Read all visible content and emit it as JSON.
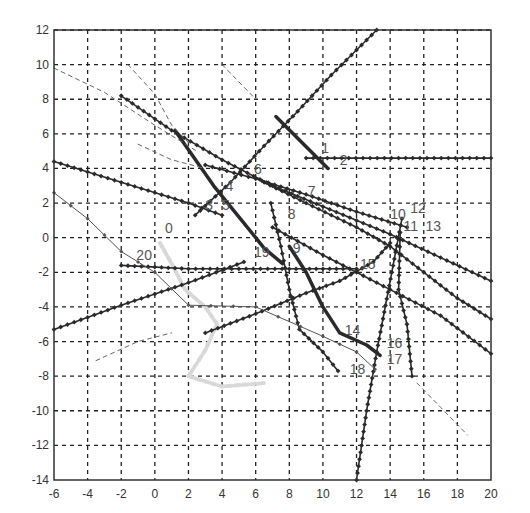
{
  "chart_data": {
    "type": "line",
    "title": "",
    "xlabel": "",
    "ylabel": "",
    "xlim": [
      -6,
      20
    ],
    "ylim": [
      -14,
      12
    ],
    "xticks": [
      -6,
      -4,
      -2,
      0,
      2,
      4,
      6,
      8,
      10,
      12,
      14,
      16,
      18,
      20
    ],
    "yticks": [
      -14,
      -12,
      -10,
      -8,
      -6,
      -4,
      -2,
      0,
      2,
      4,
      6,
      8,
      10,
      12
    ],
    "grid": true,
    "legend": "none",
    "annotations": [
      {
        "text": "0",
        "x": 0.6,
        "y": 0.3
      },
      {
        "text": "1",
        "x": 9.9,
        "y": 4.9
      },
      {
        "text": "2",
        "x": 11.0,
        "y": 4.2
      },
      {
        "text": "3",
        "x": 3.0,
        "y": 1.6
      },
      {
        "text": "4",
        "x": 4.2,
        "y": 2.7
      },
      {
        "text": "5",
        "x": 4.0,
        "y": 1.6
      },
      {
        "text": "6",
        "x": 5.9,
        "y": 3.7
      },
      {
        "text": "7",
        "x": 9.1,
        "y": 2.4
      },
      {
        "text": "8",
        "x": 7.9,
        "y": 1.1
      },
      {
        "text": "9",
        "x": 8.2,
        "y": -0.9
      },
      {
        "text": "10",
        "x": 14.0,
        "y": 1.1
      },
      {
        "text": "11",
        "x": 14.8,
        "y": 0.4
      },
      {
        "text": "12",
        "x": 15.2,
        "y": 1.4
      },
      {
        "text": "13",
        "x": 16.1,
        "y": 0.4
      },
      {
        "text": "14",
        "x": 11.3,
        "y": -5.6
      },
      {
        "text": "15",
        "x": 12.2,
        "y": -1.8
      },
      {
        "text": "16",
        "x": 13.8,
        "y": -6.4
      },
      {
        "text": "17",
        "x": 13.8,
        "y": -7.3
      },
      {
        "text": "18",
        "x": 11.6,
        "y": -7.9
      },
      {
        "text": "19",
        "x": 5.9,
        "y": -1.1
      },
      {
        "text": "20",
        "x": -1.1,
        "y": -1.3
      }
    ],
    "series": [
      {
        "name": "0",
        "style": "light",
        "points": [
          [
            0.3,
            -0.3
          ],
          [
            1.0,
            -1.5
          ],
          [
            1.8,
            -3.0
          ],
          [
            3.0,
            -4.0
          ],
          [
            3.7,
            -5.0
          ],
          [
            3.0,
            -6.5
          ],
          [
            2.0,
            -8.0
          ],
          [
            4.0,
            -8.6
          ],
          [
            6.5,
            -8.4
          ]
        ]
      },
      {
        "name": "1",
        "style": "thick",
        "points": [
          [
            7.2,
            7.0
          ],
          [
            10.3,
            4.0
          ]
        ]
      },
      {
        "name": "2",
        "style": "markers",
        "points": [
          [
            9.0,
            4.6
          ],
          [
            20.0,
            4.6
          ]
        ]
      },
      {
        "name": "3",
        "style": "markers",
        "points": [
          [
            2.4,
            1.3
          ],
          [
            4.5,
            3.2
          ],
          [
            6.5,
            5.3
          ],
          [
            8.5,
            7.3
          ],
          [
            10.5,
            9.4
          ],
          [
            13.2,
            12.0
          ]
        ]
      },
      {
        "name": "4",
        "style": "thick",
        "points": [
          [
            1.2,
            6.2
          ],
          [
            3.5,
            3.0
          ],
          [
            6.5,
            -0.6
          ],
          [
            7.6,
            -1.5
          ]
        ]
      },
      {
        "name": "5",
        "style": "markers",
        "points": [
          [
            -6.0,
            4.4
          ],
          [
            -2.0,
            3.2
          ],
          [
            2.0,
            2.0
          ],
          [
            4.0,
            1.3
          ]
        ]
      },
      {
        "name": "6",
        "style": "markers",
        "points": [
          [
            -2.0,
            8.2
          ],
          [
            1.0,
            6.2
          ],
          [
            4.0,
            4.5
          ],
          [
            7.0,
            3.0
          ],
          [
            10.0,
            1.8
          ],
          [
            14.0,
            0.2
          ],
          [
            20.0,
            -2.5
          ]
        ]
      },
      {
        "name": "7",
        "style": "markers",
        "points": [
          [
            3.0,
            4.2
          ],
          [
            6.0,
            3.4
          ],
          [
            9.0,
            2.5
          ],
          [
            12.0,
            1.5
          ],
          [
            15.0,
            0.6
          ]
        ]
      },
      {
        "name": "8",
        "style": "markers",
        "points": [
          [
            6.9,
            2.0
          ],
          [
            7.5,
            -0.5
          ],
          [
            8.0,
            -3.0
          ],
          [
            8.6,
            -5.3
          ],
          [
            10.0,
            -6.6
          ],
          [
            10.9,
            -7.7
          ]
        ]
      },
      {
        "name": "9",
        "style": "thick",
        "points": [
          [
            8.0,
            -0.5
          ],
          [
            9.0,
            -2.0
          ],
          [
            10.0,
            -4.0
          ],
          [
            11.0,
            -5.5
          ],
          [
            12.6,
            -6.2
          ],
          [
            13.4,
            -6.8
          ]
        ]
      },
      {
        "name": "10",
        "style": "markers",
        "points": [
          [
            6.5,
            3.2
          ],
          [
            9.0,
            2.0
          ],
          [
            12.0,
            0.6
          ],
          [
            14.0,
            -0.5
          ],
          [
            16.0,
            -2.0
          ],
          [
            18.0,
            -3.5
          ],
          [
            20.0,
            -4.7
          ]
        ]
      },
      {
        "name": "11",
        "style": "markers",
        "points": [
          [
            7.0,
            0.6
          ],
          [
            10.0,
            -1.0
          ],
          [
            12.0,
            -2.0
          ],
          [
            14.0,
            -3.0
          ],
          [
            17.0,
            -4.5
          ],
          [
            20.0,
            -6.7
          ]
        ]
      },
      {
        "name": "12",
        "style": "markers",
        "points": [
          [
            14.7,
            1.1
          ],
          [
            14.1,
            -2.0
          ],
          [
            13.2,
            -6.6
          ],
          [
            12.6,
            -10.0
          ],
          [
            12.0,
            -14.0
          ]
        ]
      },
      {
        "name": "13",
        "style": "markers",
        "points": [
          [
            14.6,
            0.3
          ],
          [
            14.5,
            -3.0
          ],
          [
            15.0,
            -5.0
          ],
          [
            15.3,
            -8.0
          ]
        ]
      },
      {
        "name": "14",
        "style": "markers",
        "points": [
          [
            3.0,
            -5.5
          ],
          [
            6.0,
            -4.4
          ],
          [
            9.0,
            -3.2
          ],
          [
            11.0,
            -2.5
          ],
          [
            13.0,
            -1.4
          ],
          [
            14.0,
            -0.3
          ]
        ]
      },
      {
        "name": "15",
        "style": "markers",
        "points": [
          [
            -2.0,
            -1.6
          ],
          [
            2.0,
            -1.8
          ],
          [
            8.0,
            -1.8
          ],
          [
            12.0,
            -1.8
          ]
        ]
      },
      {
        "name": "16",
        "style": "markers",
        "points": [
          [
            -6.0,
            -5.3
          ],
          [
            -2.0,
            -3.9
          ],
          [
            2.0,
            -2.6
          ],
          [
            5.3,
            -1.4
          ]
        ]
      },
      {
        "name": "17",
        "style": "thin",
        "points": [
          [
            -6.0,
            2.6
          ],
          [
            -4.0,
            1.1
          ],
          [
            -2.0,
            -0.8
          ],
          [
            0.0,
            -2.0
          ],
          [
            2.0,
            -3.9
          ],
          [
            6.0,
            -4.0
          ],
          [
            10.0,
            -5.7
          ],
          [
            12.0,
            -6.6
          ],
          [
            13.1,
            -7.6
          ]
        ]
      },
      {
        "name": "18",
        "style": "dashed",
        "points": [
          [
            -3.5,
            -7.1
          ],
          [
            -1.0,
            -6.0
          ],
          [
            1.0,
            -5.5
          ]
        ]
      },
      {
        "name": "19",
        "style": "dashed",
        "points": [
          [
            -6.0,
            9.8
          ],
          [
            -3.0,
            8.4
          ],
          [
            0.0,
            6.5
          ],
          [
            2.5,
            5.0
          ]
        ]
      },
      {
        "name": "20",
        "style": "dashed",
        "points": [
          [
            -1.6,
            10.0
          ],
          [
            0.0,
            8.3
          ],
          [
            1.0,
            6.5
          ],
          [
            2.0,
            5.5
          ]
        ]
      },
      {
        "name": "21",
        "style": "dashed",
        "points": [
          [
            -1.0,
            5.4
          ],
          [
            1.0,
            4.5
          ],
          [
            3.0,
            4.0
          ]
        ]
      },
      {
        "name": "22",
        "style": "dashed",
        "points": [
          [
            4.0,
            10.0
          ],
          [
            6.0,
            8.0
          ]
        ]
      },
      {
        "name": "23",
        "style": "dashed",
        "points": [
          [
            15.6,
            -8.4
          ],
          [
            17.0,
            -9.8
          ],
          [
            18.6,
            -11.4
          ]
        ]
      }
    ]
  },
  "colors": {
    "background": "#ffffff",
    "axis": "#333333",
    "grid": "#222222",
    "line": "#2a2a2a",
    "light_track": "#d8d8d8",
    "label": "#555555"
  }
}
